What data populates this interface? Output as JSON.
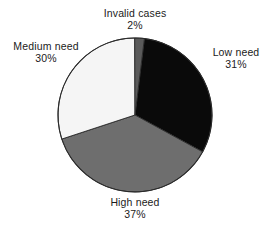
{
  "chart_data": {
    "type": "pie",
    "title": "",
    "categories": [
      "Low need",
      "High need",
      "Medium need",
      "Invalid cases"
    ],
    "values": [
      31,
      37,
      30,
      2
    ],
    "value_unit": "%",
    "legend": "none",
    "labels_position": "outside",
    "slices": [
      {
        "name": "Low need",
        "value": 31,
        "value_label": "31%",
        "color": "#0a0a0a",
        "start_angle_deg": 7,
        "end_angle_deg": 118.6
      },
      {
        "name": "High need",
        "value": 37,
        "value_label": "37%",
        "color": "#6e6e6e",
        "start_angle_deg": 118.6,
        "end_angle_deg": 251.8
      },
      {
        "name": "Medium need",
        "value": 30,
        "value_label": "30%",
        "color": "#f5f5f5",
        "start_angle_deg": 251.8,
        "end_angle_deg": 359.8
      },
      {
        "name": "Invalid cases",
        "value": 2,
        "value_label": "2%",
        "color": "#5a5a5a",
        "start_angle_deg": 359.8,
        "end_angle_deg": 7
      }
    ]
  },
  "labels": {
    "invalid": {
      "name": "Invalid cases",
      "value": "2%"
    },
    "low": {
      "name": "Low need",
      "value": "31%"
    },
    "medium": {
      "name": "Medium need",
      "value": "30%"
    },
    "high": {
      "name": "High need",
      "value": "37%"
    }
  },
  "colors": {
    "low_need": "#0a0a0a",
    "high_need": "#6e6e6e",
    "medium_need": "#f5f5f5",
    "invalid_cases": "#5a5a5a",
    "outline": "#2a2a2a",
    "background": "#ffffff",
    "text": "#1b1b1b"
  }
}
